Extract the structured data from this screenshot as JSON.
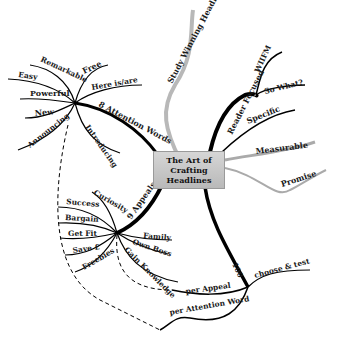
{
  "central_topic": {
    "line1": "The Art of Crafting",
    "line2": "Headlines"
  },
  "branches": {
    "study": {
      "label": "Study Winning Headlines"
    },
    "reader": {
      "label": "Reader Focused",
      "children": [
        "WIIFM",
        "So What?",
        "Specific",
        "Measurable",
        "Promise"
      ]
    },
    "attention": {
      "label": "8 Attention Words",
      "children": [
        "Free",
        "Here is/are",
        "Remarkable",
        "Easy",
        "Powerful",
        "New",
        "Announcing",
        "Introducing"
      ]
    },
    "appeals": {
      "label": "9 Appeals",
      "children": [
        "Curiosity",
        "Success",
        "Bargain",
        "Get Fit",
        "Save £",
        "Freebies",
        "Family",
        "Own Boss",
        "Gain Knowledge"
      ]
    },
    "hundred": {
      "label": "100",
      "children": [
        "choose & test",
        "per Appeal",
        "per Attention Word"
      ]
    }
  }
}
